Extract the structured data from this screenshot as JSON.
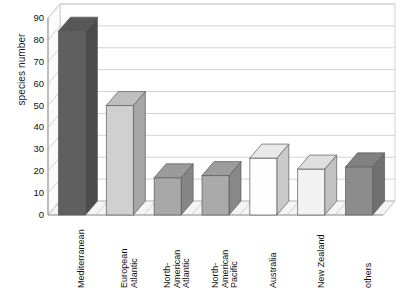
{
  "chart_data": {
    "type": "bar",
    "title": "",
    "subtitle": "",
    "xlabel": "",
    "ylabel": "species number",
    "ylim": [
      0,
      90
    ],
    "ytick_step": 10,
    "yticks": [
      0,
      10,
      20,
      30,
      40,
      50,
      60,
      70,
      80,
      90
    ],
    "ytick_labels": [
      "0",
      "10",
      "20",
      "30",
      "40",
      "50",
      "60",
      "70",
      "80",
      "90"
    ],
    "grid": true,
    "grid_axis": "y",
    "legend": false,
    "legend_position": "none",
    "three_d": true,
    "categories": [
      "Mediterranean",
      "European\nAtlantic",
      "North-\nAmerican\nAtlantic",
      "North-\nAmerican\nPacific",
      "Australia",
      "New Zealand",
      "others"
    ],
    "values": [
      84,
      50,
      17,
      18,
      26,
      21,
      22
    ],
    "bar_colors": [
      "#5f5f5f",
      "#d0d0d0",
      "#a8a8a8",
      "#aaaaaa",
      "#fdfdfd",
      "#f2f2f2",
      "#8c8c8c"
    ],
    "series": [
      {
        "name": "species number",
        "values": [
          84,
          50,
          17,
          18,
          26,
          21,
          22
        ]
      }
    ]
  },
  "style": {
    "background": "#ffffff",
    "axis_color": "#9a9a9a",
    "grid_color": "#c8c8c8",
    "text_color": "#111111",
    "floor_color": "#f4f4f4",
    "wall_color": "#ffffff"
  }
}
